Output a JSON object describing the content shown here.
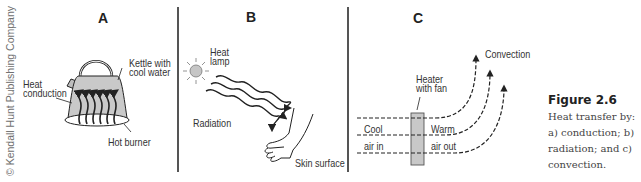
{
  "credit": "© Kendall Hunt Publishing Company",
  "panels": {
    "a": {
      "letter": "A",
      "labels": {
        "kettle": "Kettle with",
        "kettle2": "cool water",
        "conduction": "Heat",
        "conduction2": "conduction",
        "burner": "Hot burner"
      }
    },
    "b": {
      "letter": "B",
      "labels": {
        "lamp": "Heat",
        "lamp2": "lamp",
        "radiation": "Radiation",
        "skin": "Skin surface"
      }
    },
    "c": {
      "letter": "C",
      "labels": {
        "convection": "Convection",
        "heater": "Heater",
        "heater2": "with fan",
        "cool": "Cool",
        "air_in": "air in",
        "warm": "Warm",
        "air_out": "air out"
      }
    }
  },
  "caption": {
    "figure": "Figure 2.6",
    "text_first": "Heat",
    "text_rest": "transfer by: a) conduction; b) radiation; and c) convection."
  },
  "colors": {
    "ink": "#222222",
    "fill_gray": "#c8c8c8",
    "divider": "#555555"
  }
}
